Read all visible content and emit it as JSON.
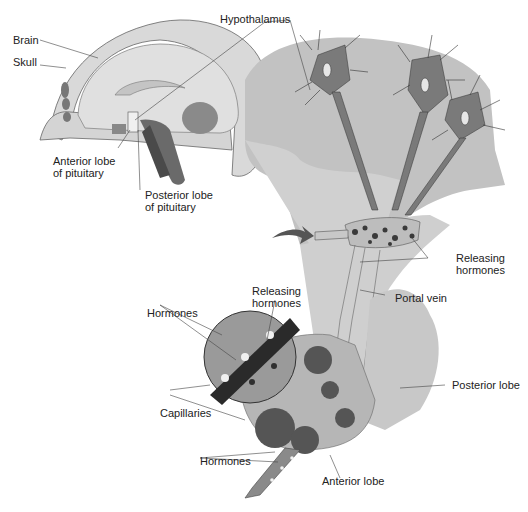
{
  "figure": {
    "colors": {
      "background": "#ffffff",
      "tissue_light": "#d6d6d6",
      "tissue_mid": "#bdbdbd",
      "tissue_dark": "#8c8c8c",
      "neuron": "#7a7a7a",
      "vessel": "#3a3a3a",
      "label_text": "#222222",
      "leader_line": "#444444"
    }
  },
  "labels": {
    "brain": "Brain",
    "skull": "Skull",
    "hypothalamus": "Hypothalamus",
    "anterior_lobe_pituitary_1": "Anterior lobe",
    "anterior_lobe_pituitary_2": "of pituitary",
    "posterior_lobe_pituitary_1": "Posterior lobe",
    "posterior_lobe_pituitary_2": "of pituitary",
    "releasing_hormones_right_1": "Releasing",
    "releasing_hormones_right_2": "hormones",
    "portal_vein": "Portal vein",
    "releasing_hormones_inset_1": "Releasing",
    "releasing_hormones_inset_2": "hormones",
    "hormones_inset": "Hormones",
    "capillaries": "Capillaries",
    "posterior_lobe": "Posterior lobe",
    "hormones_bottom": "Hormones",
    "anterior_lobe": "Anterior lobe"
  }
}
